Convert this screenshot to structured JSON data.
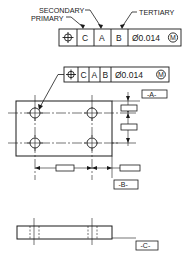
{
  "callouts": {
    "secondary": "SECONDARY",
    "primary": "PRIMARY",
    "tertiary": "TERTIARY"
  },
  "top_frame": {
    "symbol": "position-icon",
    "datums": [
      "C",
      "A",
      "B"
    ],
    "tolerance": "Ø0.014",
    "modifier": "M"
  },
  "part_frame": {
    "symbol": "position-icon",
    "datums": [
      "C",
      "A",
      "B"
    ],
    "tolerance": "Ø0.014",
    "modifier": "M"
  },
  "datum_labels": {
    "a": "-A-",
    "b": "-B-",
    "c": "-C-"
  },
  "colors": {
    "line": "#1a1a1a",
    "background": "#ffffff"
  }
}
